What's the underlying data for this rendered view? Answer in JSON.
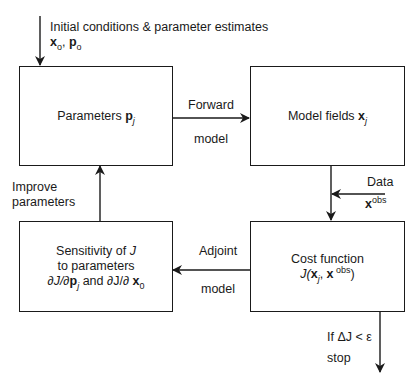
{
  "diagram": {
    "type": "flowchart",
    "title": "",
    "input": {
      "label": "Initial conditions & parameter estimates",
      "vars": {
        "x": "x",
        "x_sub": "o",
        "sep": ", ",
        "p": "p",
        "p_sub": "o"
      }
    },
    "boxes": {
      "parameters": {
        "text": "Parameters ",
        "var": "p",
        "sub": "j"
      },
      "model_fields": {
        "text": "Model fields ",
        "var": "x",
        "sub": "j"
      },
      "sensitivity": {
        "line1": "Sensitivity of ",
        "line1_var": "J",
        "line2": "to parameters",
        "line3_a": "∂J/∂",
        "line3_p": "p",
        "line3_p_sub": "j",
        "line3_and": " and ∂J/∂ ",
        "line3_x": "x",
        "line3_x_sub": "0"
      },
      "cost_function": {
        "line1": "Cost function",
        "J": "J(",
        "x": "x",
        "x_sub": "j",
        "comma": ", ",
        "xobs": "x",
        "obs_sup": " obs",
        "close": ")"
      }
    },
    "edges": {
      "forward": {
        "top": "Forward",
        "bottom": "model"
      },
      "adjoint": {
        "top": "Adjoint",
        "bottom": "model"
      },
      "improve": {
        "line1": "Improve",
        "line2": "parameters"
      },
      "data": {
        "label": "Data",
        "var": "x",
        "sup": "obs"
      },
      "stop": {
        "line1": "If ΔJ < ε",
        "line2": "stop"
      }
    },
    "colors": {
      "stroke": "#1a1a1a",
      "background": "#ffffff"
    }
  }
}
